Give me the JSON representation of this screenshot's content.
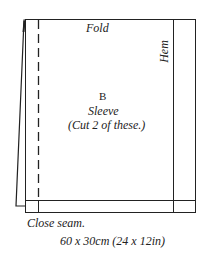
{
  "diagram": {
    "fold_label": "Fold",
    "hem_label": "Hem",
    "piece_letter": "B",
    "piece_name": "Sleeve",
    "piece_instruction": "(Cut 2 of these.)",
    "seam_label": "Close seam.",
    "dimensions": "60 x 30cm (24 x 12in)",
    "line_color": "#222222"
  }
}
